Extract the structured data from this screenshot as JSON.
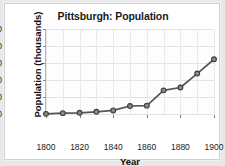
{
  "chart_data": {
    "type": "line",
    "title": "Pittsburgh: Population",
    "xlabel": "Year",
    "ylabel": "Population (thousands)",
    "x": [
      1800,
      1810,
      1820,
      1830,
      1840,
      1850,
      1860,
      1870,
      1880,
      1890,
      1900
    ],
    "values": [
      1,
      5,
      7,
      13,
      21,
      47,
      49,
      139,
      156,
      238,
      322
    ],
    "series": [
      {
        "name": "Population (thousands)",
        "values": [
          1,
          5,
          7,
          13,
          21,
          47,
          49,
          139,
          156,
          238,
          322
        ]
      }
    ],
    "xlim": [
      1800,
      1900
    ],
    "ylim": [
      0,
      500
    ],
    "xticks": [
      1800,
      1820,
      1840,
      1860,
      1880,
      1900
    ],
    "xtick_labels": [
      "1800",
      "1820",
      "1840",
      "1860",
      "1880",
      "1900"
    ],
    "yticks": [
      0,
      100,
      200,
      300,
      400,
      500
    ],
    "ytick_labels": [
      "0",
      "100",
      "200",
      "300",
      "400",
      "500"
    ],
    "grid": true,
    "legend": false,
    "legend_position": "none",
    "marker": "circle",
    "line_color": "#555555",
    "marker_fill": "#8a8a8a",
    "marker_edge": "#3d3d3d",
    "grid_color": "#e3e3e3",
    "plot_background": "#fdfdfd",
    "figure_background": "#e8e8e8"
  }
}
